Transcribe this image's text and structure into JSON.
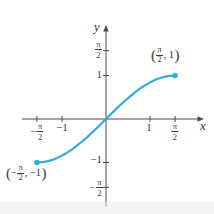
{
  "chart_data": {
    "type": "line",
    "title": "",
    "axis_labels": {
      "x": "x",
      "y": "y"
    },
    "axis_color": "#4a4a4a",
    "text_color": "#3a3a3a",
    "grid": false,
    "legend": "none",
    "xlim": [
      -1.91,
      2.25
    ],
    "ylim": [
      -2.02,
      2.14
    ],
    "x_ticks": [
      {
        "value": -1.5708,
        "sign": "−",
        "num": "π",
        "den": "2"
      },
      {
        "value": -1,
        "label": "−1"
      },
      {
        "value": 1,
        "label": "1"
      },
      {
        "value": 1.5708,
        "num": "π",
        "den": "2"
      }
    ],
    "y_ticks": [
      {
        "value": 1.5708,
        "num": "π",
        "den": "2"
      },
      {
        "value": 1,
        "label": "1"
      },
      {
        "value": -1,
        "label": "−1"
      },
      {
        "value": -1.5708,
        "sign": "−",
        "num": "π",
        "den": "2"
      }
    ],
    "series": [
      {
        "name": "curve",
        "shape": "sine",
        "color": "#35a9dc",
        "stroke_width": 2.2,
        "points": [
          [
            -1.571,
            -1
          ],
          [
            -1.374,
            -0.981
          ],
          [
            -1.178,
            -0.924
          ],
          [
            -0.982,
            -0.831
          ],
          [
            -0.785,
            -0.707
          ],
          [
            -0.589,
            -0.556
          ],
          [
            -0.393,
            -0.383
          ],
          [
            -0.196,
            -0.195
          ],
          [
            0,
            0
          ],
          [
            0.196,
            0.195
          ],
          [
            0.393,
            0.383
          ],
          [
            0.589,
            0.556
          ],
          [
            0.785,
            0.707
          ],
          [
            0.982,
            0.831
          ],
          [
            1.178,
            0.924
          ],
          [
            1.374,
            0.981
          ],
          [
            1.571,
            1
          ]
        ],
        "endpoints": [
          [
            -1.5708,
            -1
          ],
          [
            1.5708,
            1
          ]
        ],
        "endpoint_dot_radius": 2.7
      }
    ],
    "annotations": [
      {
        "paren_open": "(",
        "sign": "",
        "num": "π",
        "den": "2",
        "suffix": ", 1",
        "paren_close": ")",
        "anchor": [
          1.5708,
          1
        ]
      },
      {
        "paren_open": "(",
        "sign": "−",
        "num": "π",
        "den": "2",
        "suffix": ", −1",
        "paren_close": ")",
        "anchor": [
          -1.5708,
          -1
        ]
      }
    ],
    "layout": {
      "origin_px": [
        106,
        119
      ],
      "px_per_unit": [
        44,
        43.5
      ],
      "x_axis_px": [
        22,
        204
      ],
      "y_axis_px": [
        25,
        207
      ],
      "tick_half_len": 3
    }
  }
}
